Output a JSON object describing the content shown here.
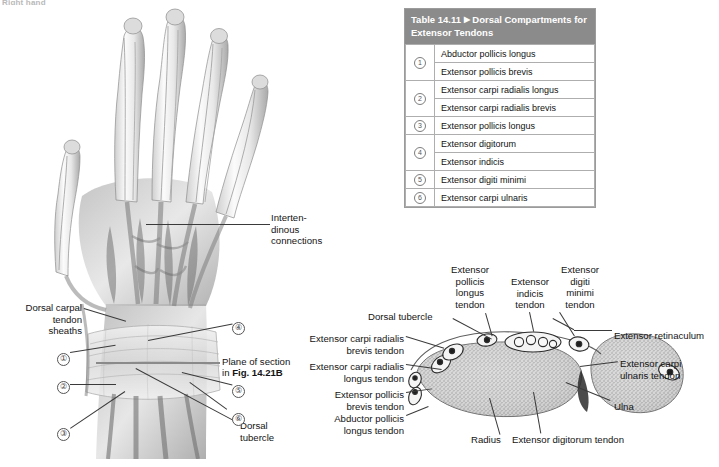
{
  "page": {
    "header_cut": "Right hand",
    "bg": "#ffffff"
  },
  "table": {
    "name": "Table 14.11",
    "marker": "▶",
    "title": "Dorsal Compartments for Extensor Tendons",
    "header_bg": "#8b8b8b",
    "header_fg": "#ffffff",
    "border": "#aeaeae",
    "rows": [
      {
        "num": "①",
        "group_span": 2,
        "label": "Abductor pollicis longus"
      },
      {
        "num": "",
        "group_span": 0,
        "label": "Extensor pollicis brevis"
      },
      {
        "num": "②",
        "group_span": 2,
        "label": "Extensor carpi radialis longus"
      },
      {
        "num": "",
        "group_span": 0,
        "label": "Extensor carpi radialis brevis"
      },
      {
        "num": "③",
        "group_span": 1,
        "label": "Extensor pollicis longus"
      },
      {
        "num": "④",
        "group_span": 2,
        "label": "Extensor digitorum"
      },
      {
        "num": "",
        "group_span": 0,
        "label": "Extensor indicis"
      },
      {
        "num": "⑤",
        "group_span": 1,
        "label": "Extensor digiti minimi"
      },
      {
        "num": "⑥",
        "group_span": 1,
        "label": "Extensor carpi ulnaris"
      }
    ]
  },
  "hand_figure": {
    "labels": {
      "intertendinous": "Interten-\ndinous\nconnections",
      "dorsal_carpal": "Dorsal carpal\ntendon\nsheaths",
      "plane_line1": "Plane of section",
      "plane_line2_pre": "in ",
      "plane_line2_bold": "Fig. 14.21B",
      "dorsal_tubercle": "Dorsal\ntubercle"
    },
    "callouts": [
      {
        "id": "1",
        "glyph": "①"
      },
      {
        "id": "2",
        "glyph": "②"
      },
      {
        "id": "3",
        "glyph": "③"
      },
      {
        "id": "4",
        "glyph": "④"
      },
      {
        "id": "5",
        "glyph": "⑤"
      },
      {
        "id": "6",
        "glyph": "⑥"
      }
    ]
  },
  "cross_section": {
    "labels": {
      "ext_poll_long": "Extensor\npollicis\nlongus\ntendon",
      "ext_indicis": "Extensor\nindicis\ntendon",
      "ext_dig_min": "Extensor\ndigiti\nminimi\ntendon",
      "dorsal_tubercle": "Dorsal tubercle",
      "ecr_brevis": "Extensor carpi radialis\nbrevis tendon",
      "ecr_longus": "Extensor carpi radialis\nlongus tendon",
      "ext_poll_brev": "Extensor pollicis\nbrevis tendon",
      "abd_poll_long": "Abductor pollicis\nlongus tendon",
      "retinaculum": "Extensor retinaculum",
      "ecu": "Extensor carpi\nulnaris tendon",
      "ulna": "Ulna",
      "radius": "Radius",
      "ext_digitorum": "Extensor digitorum tendon"
    }
  }
}
